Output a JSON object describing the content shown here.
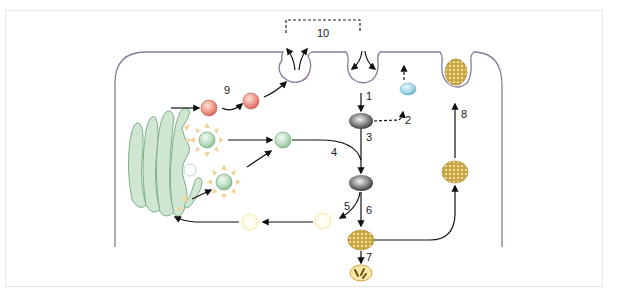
{
  "diagram": {
    "type": "cell-trafficking-pathways",
    "step_labels": {
      "s1": "1",
      "s2": "2",
      "s3": "3",
      "s4": "4",
      "s5": "5",
      "s6": "6",
      "s7": "7",
      "s8": "8",
      "s9": "9",
      "s10": "10"
    },
    "colors": {
      "membrane": "#8a7a9a",
      "golgi_fill": "#cfe6d2",
      "golgi_stroke": "#7fb08a",
      "secretory_vesicle": "#e8867a",
      "coated_vesicle": "#b9dcc0",
      "coat_spikes": "#f0d49a",
      "endosome": "#555555",
      "recycling_vesicle": "#8ccbe0",
      "retrograde_vesicle": "#fbf3c8",
      "lysosome": "#c9a640",
      "arrow": "#111111",
      "frame_border": "#e6e6e6"
    }
  }
}
